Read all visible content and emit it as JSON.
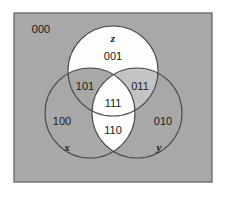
{
  "figure": {
    "type": "venn-diagram-3-set",
    "background_color": "#ffffff",
    "universe": {
      "label": "000",
      "fill_color": "#a8a8a8",
      "border_color": "#6d6d6d",
      "x": 14,
      "y": 13,
      "width": 198,
      "height": 169,
      "label_x": 41,
      "label_y": 30
    },
    "outline_color": "#4a4a4a",
    "shaded_color": "#a8a8a8",
    "light_shaded_color": "#c4c4c4",
    "white_color": "#fdfdfd",
    "sets": [
      {
        "name": "z",
        "label": "z",
        "cx": 113,
        "cy": 71,
        "r": 45,
        "label_x": 113,
        "label_y": 39,
        "fill": "white"
      },
      {
        "name": "x",
        "label": "x",
        "cx": 90,
        "cy": 113,
        "r": 45,
        "label_x": 67,
        "label_y": 148,
        "fill": "shaded"
      },
      {
        "name": "y",
        "label": "y",
        "cx": 137,
        "cy": 113,
        "r": 45,
        "label_x": 159,
        "label_y": 148,
        "fill": "shaded"
      }
    ],
    "regions": [
      {
        "code": "000",
        "name": "outside-all",
        "membership": "none",
        "fill": "shaded",
        "x": 41,
        "y": 30
      },
      {
        "code": "001",
        "name": "z-only",
        "membership": "z",
        "fill": "white",
        "x": 113,
        "y": 57
      },
      {
        "code": "101",
        "name": "x-and-z",
        "membership": "x,z",
        "fill": "shaded",
        "x": 85,
        "y": 87
      },
      {
        "code": "011",
        "name": "y-and-z",
        "membership": "y,z",
        "fill": "light",
        "x": 140,
        "y": 87
      },
      {
        "code": "111",
        "name": "x-y-and-z",
        "membership": "x,y,z",
        "fill": "white",
        "x": 113,
        "y": 104
      },
      {
        "code": "100",
        "name": "x-only",
        "membership": "x",
        "fill": "shaded",
        "x": 62,
        "y": 122
      },
      {
        "code": "010",
        "name": "y-only",
        "membership": "y",
        "fill": "shaded",
        "x": 163,
        "y": 122
      },
      {
        "code": "110",
        "name": "x-and-y",
        "membership": "x,y",
        "fill": "white",
        "x": 113,
        "y": 131
      }
    ]
  }
}
